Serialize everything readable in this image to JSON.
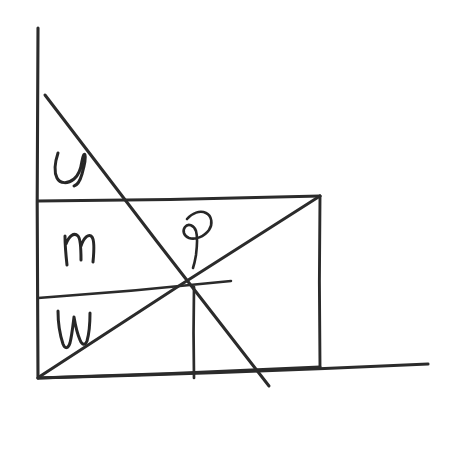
{
  "document": {
    "kind": "hand-drawn-sketch",
    "title": "Hand-drawn geometry sketch with axes, rectangle, diagonals and labels",
    "background_color": "#ffffff",
    "ink_color": "#2b2b2b",
    "canvas": {
      "width": 460,
      "height": 450
    }
  },
  "axes": {
    "y_axis": {
      "name": "vertical-axis",
      "from": {
        "x": 38,
        "y": 28
      },
      "to": {
        "x": 38,
        "y": 378
      }
    },
    "x_axis": {
      "name": "horizontal-axis",
      "from": {
        "x": 38,
        "y": 378
      },
      "to": {
        "x": 428,
        "y": 364
      }
    },
    "origin": {
      "x": 38,
      "y": 378
    }
  },
  "rectangle": {
    "name": "main-rectangle",
    "top_left": {
      "x": 38,
      "y": 201
    },
    "top_right": {
      "x": 320,
      "y": 196
    },
    "bottom_right": {
      "x": 320,
      "y": 367
    },
    "bottom_left": {
      "x": 38,
      "y": 378
    }
  },
  "divider": {
    "name": "horizontal-divider",
    "from": {
      "x": 38,
      "y": 298
    },
    "to": {
      "x": 231,
      "y": 281
    }
  },
  "diagonals": {
    "descending": {
      "name": "descending-diagonal",
      "from": {
        "x": 45,
        "y": 95
      },
      "to": {
        "x": 269,
        "y": 386
      }
    },
    "ascending": {
      "name": "ascending-diagonal",
      "from": {
        "x": 39,
        "y": 377
      },
      "to": {
        "x": 320,
        "y": 196
      }
    }
  },
  "drop_line": {
    "name": "vertical-drop-line",
    "from": {
      "x": 194,
      "y": 287
    },
    "to": {
      "x": 194,
      "y": 378
    }
  },
  "intersection": {
    "name": "diagonal-intersection-point",
    "x": 194,
    "y": 287
  },
  "labels": [
    {
      "id": "label-s",
      "text": "s",
      "script": "handwritten-lowercase",
      "x": 68,
      "y": 172,
      "region": "upper-left-triangle"
    },
    {
      "id": "label-m",
      "text": "m",
      "script": "handwritten-lowercase",
      "x": 75,
      "y": 255,
      "region": "middle-band"
    },
    {
      "id": "label-w",
      "text": "w",
      "script": "handwritten-lowercase",
      "x": 68,
      "y": 330,
      "region": "lower-band"
    },
    {
      "id": "label-p",
      "text": "p",
      "script": "handwritten-cursive",
      "x": 197,
      "y": 238,
      "region": "near-intersection"
    }
  ]
}
